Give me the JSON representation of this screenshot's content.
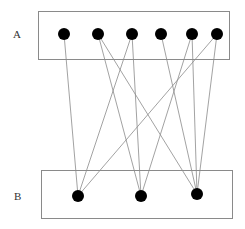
{
  "labels": {
    "top": "A",
    "bottom": "B"
  },
  "colors": {
    "node": "#000000",
    "edge": "#8a8a8a",
    "box": "#8a8a8a",
    "background": "#ffffff"
  },
  "boxes": {
    "top": {
      "x": 38,
      "y": 11,
      "w": 191,
      "h": 48
    },
    "bottom": {
      "x": 41,
      "y": 170,
      "w": 191,
      "h": 48
    }
  },
  "nodes": {
    "top": [
      {
        "id": "A1",
        "x": 64,
        "y": 34
      },
      {
        "id": "A2",
        "x": 98,
        "y": 34
      },
      {
        "id": "A3",
        "x": 132,
        "y": 34
      },
      {
        "id": "A4",
        "x": 161,
        "y": 34
      },
      {
        "id": "A5",
        "x": 192,
        "y": 34
      },
      {
        "id": "A6",
        "x": 217,
        "y": 34
      }
    ],
    "bottom": [
      {
        "id": "B1",
        "x": 78,
        "y": 196
      },
      {
        "id": "B2",
        "x": 141,
        "y": 196
      },
      {
        "id": "B3",
        "x": 197,
        "y": 194
      }
    ]
  },
  "edges": [
    [
      "A1",
      "B1"
    ],
    [
      "A2",
      "B2"
    ],
    [
      "A2",
      "B3"
    ],
    [
      "A3",
      "B1"
    ],
    [
      "A3",
      "B2"
    ],
    [
      "A4",
      "B3"
    ],
    [
      "A5",
      "B2"
    ],
    [
      "A5",
      "B3"
    ],
    [
      "A6",
      "B1"
    ],
    [
      "A6",
      "B3"
    ]
  ]
}
